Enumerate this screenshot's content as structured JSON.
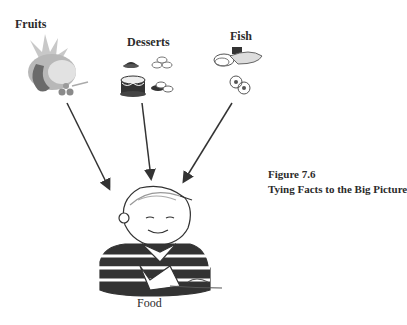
{
  "diagram": {
    "type": "convergence",
    "sources": [
      {
        "label": "Fruits",
        "icon": "fruits-illustration"
      },
      {
        "label": "Desserts",
        "icon": "desserts-illustration"
      },
      {
        "label": "Fish",
        "icon": "fish-illustration"
      }
    ],
    "target": {
      "label": "Food",
      "icon": "boy-eating-illustration"
    },
    "edges": [
      {
        "from": "Fruits",
        "to": "Food"
      },
      {
        "from": "Desserts",
        "to": "Food"
      },
      {
        "from": "Fish",
        "to": "Food"
      }
    ]
  },
  "caption": {
    "figure": "Figure 7.6",
    "title": "Tying Facts to the Big Picture"
  },
  "colors": {
    "text": "#2b2b2b",
    "arrow": "#333333",
    "illustration_gray": "#9a9a9a"
  }
}
